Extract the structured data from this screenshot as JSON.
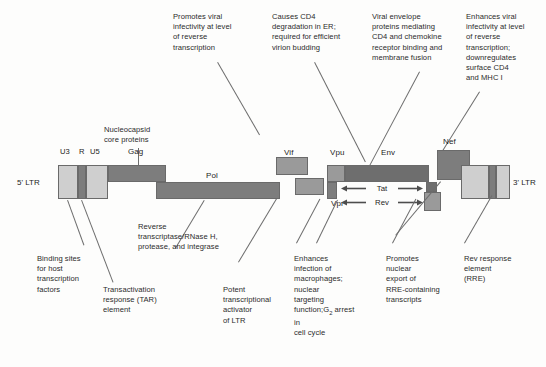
{
  "figure": {
    "background": "#fdfdfc",
    "colors": {
      "light_gray": "#cfcfcf",
      "mid_gray": "#9a9a9a",
      "dark_gray": "#7d7d7d",
      "darker_gray": "#6e6e6e",
      "outline": "#6a6a6a",
      "text": "#2b2b2b"
    }
  },
  "ltr": {
    "left_label": "5' LTR",
    "right_label": "3' LTR",
    "segments": [
      "U3",
      "R",
      "U5"
    ]
  },
  "genes": {
    "gag": "Gag",
    "pol": "Pol",
    "vif": "Vif",
    "vpu": "Vpu",
    "vpr": "Vpr",
    "env": "Env",
    "nef": "Nef",
    "tat": "Tat",
    "rev": "Rev"
  },
  "annotations": {
    "nucleocapsid": "Nucleocapsid\ncore proteins",
    "vif_function": "Promotes viral\ninfectivity at level\nof reverse\ntranscription",
    "vpu_function": "Causes CD4\ndegradation in ER;\nrequired for efficient\nvirion budding",
    "env_function": "Viral envelope\nproteins mediating\nCD4 and chemokine\nreceptor binding and\nmembrane fusion",
    "nef_function": "Enhances viral\ninfectivity at level\nof reverse\ntranscription;\ndownregulates\nsurface CD4\nand MHC I",
    "u3_function": "Binding sites\nfor host\ntranscription\nfactors",
    "r_function": "Transactivation\nresponse (TAR)\nelement",
    "pol_function": "Reverse\ntranscriptase/RNase H,\nprotease, and integrase",
    "tat_function": "Potent\ntranscriptional\nactivator\nof LTR",
    "vpr_function_a": "Enhances\ninfection of\nmacrophages;\nnuclear\ntargeting\nfunction;",
    "vpr_function_b": "G",
    "vpr_function_b_sub": "2",
    "vpr_function_b_rest": " arrest in",
    "vpr_function_c": "cell cycle",
    "rev_function": "Promotes\nnuclear\nexport of\nRRE-containing\ntranscripts",
    "rre_function": "Rev response\nelement\n(RRE)"
  }
}
